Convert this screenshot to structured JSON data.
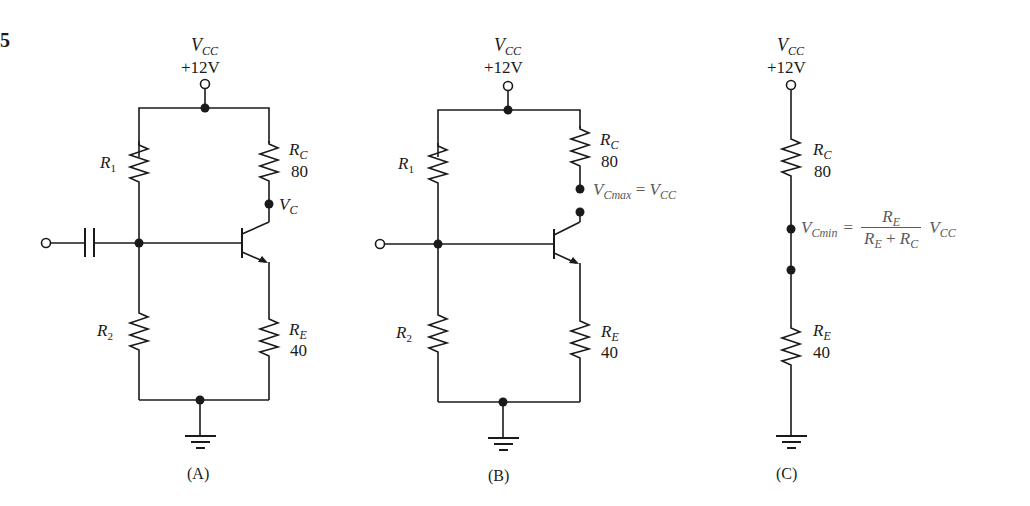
{
  "figure_number_fragment": "5",
  "supply": {
    "symbol": "V",
    "subscript": "CC",
    "value": "+12V"
  },
  "resistors": {
    "R1": {
      "symbol": "R",
      "subscript": "1"
    },
    "R2": {
      "symbol": "R",
      "subscript": "2"
    },
    "RC": {
      "symbol": "R",
      "subscript": "C",
      "value": "80"
    },
    "RE": {
      "symbol": "R",
      "subscript": "E",
      "value": "40"
    }
  },
  "panels": [
    {
      "id": "A",
      "caption": "(A)",
      "node_label": {
        "symbol": "V",
        "subscript": "C"
      }
    },
    {
      "id": "B",
      "caption": "(B)",
      "annotation": {
        "lhs_symbol": "V",
        "lhs_subscript": "Cmax",
        "eq": "=",
        "rhs_symbol": "V",
        "rhs_subscript": "CC"
      }
    },
    {
      "id": "C",
      "caption": "(C)",
      "annotation": {
        "lhs_symbol": "V",
        "lhs_subscript": "Cmin",
        "eq": "=",
        "num_symbol": "R",
        "num_subscript": "E",
        "den_a_symbol": "R",
        "den_a_subscript": "E",
        "den_op": "+",
        "den_b_symbol": "R",
        "den_b_subscript": "C",
        "factor_symbol": "V",
        "factor_subscript": "CC"
      }
    }
  ],
  "colors": {
    "wire": "#1a1a1a",
    "annotation": "#5a5a5a",
    "background": "#ffffff"
  }
}
